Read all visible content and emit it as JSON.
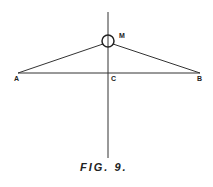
{
  "figure": {
    "caption": "FIG. 9.",
    "labels": {
      "A": "A",
      "B": "B",
      "C": "C",
      "M": "M"
    }
  },
  "geometry": {
    "A": [
      18,
      73
    ],
    "B": [
      200,
      73
    ],
    "C": [
      108,
      73
    ],
    "M": [
      108,
      41
    ],
    "vertical_line": {
      "x": 108,
      "y1": 12,
      "y2": 158
    },
    "circle_radius": 6
  }
}
